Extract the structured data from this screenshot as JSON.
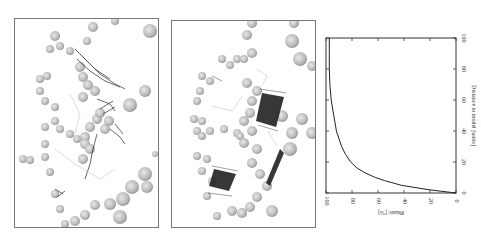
{
  "panels": [
    {
      "id": "structure-view-1",
      "description": "Molecular structure view with sphere atoms and mesh densities"
    },
    {
      "id": "structure-view-2",
      "description": "Molecular structure view with sphere atoms and dark planar mesh densities"
    }
  ],
  "chart_data": {
    "type": "line",
    "orientation": "rotated-90",
    "title": "",
    "xlabel": "Distance to model [units]",
    "ylabel": "Phasic [%]",
    "xlim": [
      0,
      100
    ],
    "ylim": [
      0,
      100
    ],
    "x_ticks": [
      "0",
      "20",
      "40",
      "60",
      "80",
      "100"
    ],
    "y_ticks": [
      "0",
      "20",
      "40",
      "60",
      "80",
      "100"
    ],
    "grid": false,
    "series": [
      {
        "name": "curve",
        "x": [
          0,
          2,
          5,
          8,
          10,
          13,
          16,
          20,
          25,
          30,
          35,
          40,
          50,
          60,
          70,
          80,
          90,
          100
        ],
        "y": [
          0,
          20,
          42,
          55,
          62,
          70,
          76,
          81,
          85,
          88,
          90,
          92,
          94,
          96,
          97,
          97.5,
          97.5,
          97.5
        ]
      }
    ]
  }
}
